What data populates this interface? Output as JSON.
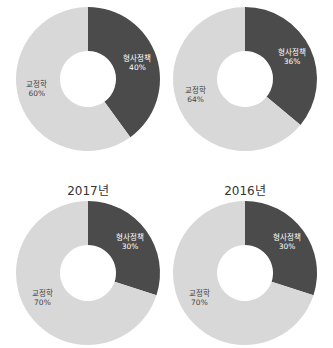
{
  "colors": {
    "dark": "#4b4b4b",
    "light": "#d8d8d8",
    "dark_label": "#ffffff",
    "light_label": "#444444"
  },
  "chart_data": [
    {
      "type": "pie",
      "title": "",
      "position": "top-left",
      "categories": [
        "형사정책",
        "교정학"
      ],
      "values": [
        40,
        60
      ],
      "labels": [
        {
          "name": "형사정책",
          "pct": "40%"
        },
        {
          "name": "교정학",
          "pct": "60%"
        }
      ],
      "donut": true
    },
    {
      "type": "pie",
      "title": "",
      "position": "top-right",
      "categories": [
        "형사정책",
        "교정학"
      ],
      "values": [
        36,
        64
      ],
      "labels": [
        {
          "name": "형사정책",
          "pct": "36%"
        },
        {
          "name": "교정학",
          "pct": "64%"
        }
      ],
      "donut": true
    },
    {
      "type": "pie",
      "title": "2017년",
      "position": "bottom-left",
      "categories": [
        "형사정책",
        "교정학"
      ],
      "values": [
        30,
        70
      ],
      "labels": [
        {
          "name": "형사정책",
          "pct": "30%"
        },
        {
          "name": "교정학",
          "pct": "70%"
        }
      ],
      "donut": true
    },
    {
      "type": "pie",
      "title": "2016년",
      "position": "bottom-right",
      "categories": [
        "형사정책",
        "교정학"
      ],
      "values": [
        30,
        70
      ],
      "labels": [
        {
          "name": "형사정책",
          "pct": "30%"
        },
        {
          "name": "교정학",
          "pct": "70%"
        }
      ],
      "donut": true
    }
  ]
}
